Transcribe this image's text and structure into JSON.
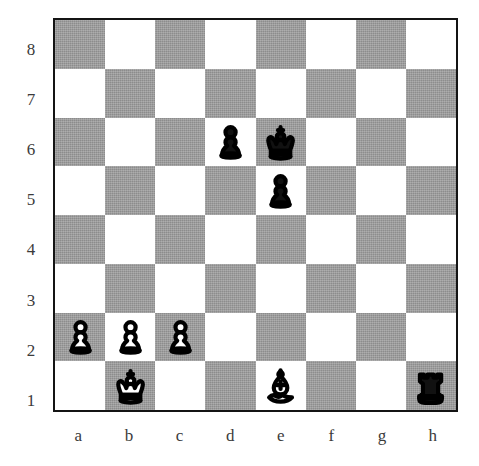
{
  "diagram": {
    "type": "chess-board",
    "orientation": "white-bottom",
    "board_size": 8,
    "colors": {
      "light_square": "#ffffff",
      "dark_square": "#9b9b9b",
      "border": "#141414",
      "label": "#3b3b3b",
      "white_piece": "#ffffff",
      "black_piece": "#111111"
    }
  },
  "labels": {
    "files": [
      "a",
      "b",
      "c",
      "d",
      "e",
      "f",
      "g",
      "h"
    ],
    "ranks": [
      "8",
      "7",
      "6",
      "5",
      "4",
      "3",
      "2",
      "1"
    ]
  },
  "position": {
    "fen": "8/8/3pk3/4p3/8/8/PPP5/1K2B2r",
    "pieces": [
      {
        "square": "d6",
        "color": "black",
        "type": "pawn",
        "glyph": "black-pawn-icon",
        "file": 3,
        "rank": 6
      },
      {
        "square": "e6",
        "color": "black",
        "type": "king",
        "glyph": "black-king-icon",
        "file": 4,
        "rank": 6
      },
      {
        "square": "e5",
        "color": "black",
        "type": "pawn",
        "glyph": "black-pawn-icon",
        "file": 4,
        "rank": 5
      },
      {
        "square": "a2",
        "color": "white",
        "type": "pawn",
        "glyph": "white-pawn-icon",
        "file": 0,
        "rank": 2
      },
      {
        "square": "b2",
        "color": "white",
        "type": "pawn",
        "glyph": "white-pawn-icon",
        "file": 1,
        "rank": 2
      },
      {
        "square": "c2",
        "color": "white",
        "type": "pawn",
        "glyph": "white-pawn-icon",
        "file": 2,
        "rank": 2
      },
      {
        "square": "b1",
        "color": "white",
        "type": "king",
        "glyph": "white-king-icon",
        "file": 1,
        "rank": 1
      },
      {
        "square": "e1",
        "color": "white",
        "type": "bishop",
        "glyph": "white-bishop-icon",
        "file": 4,
        "rank": 1
      },
      {
        "square": "h1",
        "color": "black",
        "type": "rook",
        "glyph": "black-rook-icon",
        "file": 7,
        "rank": 1
      }
    ],
    "white_pieces": [
      "Ka2 pawns a2 b2 c2",
      "Kb1",
      "Be1"
    ],
    "black_pieces": [
      "pd6",
      "Ke6",
      "pe5",
      "Rh1"
    ]
  }
}
